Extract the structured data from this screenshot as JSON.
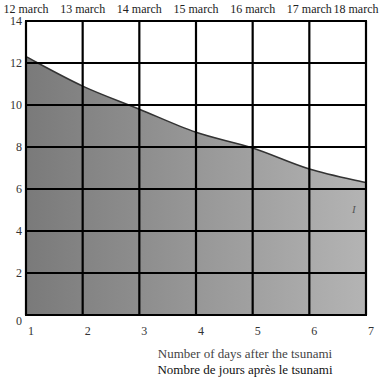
{
  "chart_data": {
    "type": "area",
    "title": "",
    "xlabel": "Number of days after the tsunami",
    "xlabel_secondary": "Nombre de jours après le tsunami",
    "ylabel": "",
    "x": [
      1,
      2,
      3,
      4,
      5,
      6,
      7
    ],
    "top_axis_labels": [
      "12 march",
      "13 march",
      "14 march",
      "15 march",
      "16 march",
      "17 march",
      "18 march"
    ],
    "series": [
      {
        "name": "I",
        "values": [
          12.3,
          10.9,
          9.8,
          8.7,
          7.95,
          6.95,
          6.3
        ]
      }
    ],
    "xlim": [
      1,
      7
    ],
    "ylim": [
      0,
      14
    ],
    "y_ticks": [
      0,
      2,
      4,
      6,
      8,
      10,
      12,
      14
    ],
    "x_ticks": [
      1,
      2,
      3,
      4,
      5,
      6,
      7
    ],
    "grid": true,
    "legend": null,
    "annotations": [
      {
        "text": "I",
        "x": 6.8,
        "y": 5.0
      }
    ],
    "fill": {
      "gradient_start": "#7a7a7a",
      "gradient_end": "#b4b4b4"
    },
    "grid_color": "#000000",
    "curve_color": "#333333"
  },
  "labels": {
    "top_dates": [
      "12 march",
      "13 march",
      "14 march",
      "15 march",
      "16 march",
      "17 march",
      "18 march"
    ],
    "y_ticks": [
      "14",
      "12",
      "10",
      "8",
      "6",
      "4",
      "2",
      "0"
    ],
    "x_ticks": [
      "1",
      "2",
      "3",
      "4",
      "5",
      "6",
      "7"
    ],
    "xlabel_en": "Number of days after the tsunami",
    "xlabel_fr": "Nombre de jours après le tsunami",
    "series_mark": "I"
  }
}
